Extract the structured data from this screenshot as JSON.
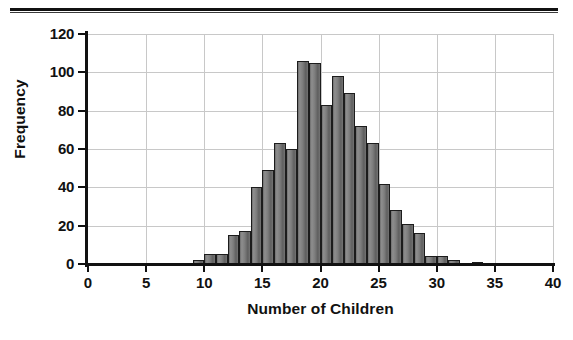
{
  "chart_data": {
    "type": "bar",
    "title": "",
    "subtitle": "",
    "xlabel": "Number of Children",
    "ylabel": "Frequency",
    "xlim": [
      0,
      40
    ],
    "ylim": [
      0,
      120
    ],
    "grid": true,
    "legend": "none",
    "bin_width": 1,
    "x_tick_labels": [
      "0",
      "5",
      "10",
      "15",
      "20",
      "25",
      "30",
      "35",
      "40"
    ],
    "x_ticks": [
      0,
      5,
      10,
      15,
      20,
      25,
      30,
      35,
      40
    ],
    "y_tick_labels": [
      "0",
      "20",
      "40",
      "60",
      "80",
      "100",
      "120"
    ],
    "y_ticks": [
      0,
      20,
      40,
      60,
      80,
      100,
      120
    ],
    "categories": [
      9,
      10,
      11,
      12,
      13,
      14,
      15,
      16,
      17,
      18,
      19,
      20,
      21,
      22,
      23,
      24,
      25,
      26,
      27,
      28,
      29,
      30,
      31,
      32,
      33
    ],
    "values": [
      2,
      5,
      5,
      15,
      17,
      40,
      49,
      63,
      60,
      106,
      105,
      83,
      98,
      89,
      72,
      63,
      42,
      28,
      21,
      16,
      4,
      4,
      2,
      0,
      1
    ],
    "bar_fill_color": "#7d7d7d",
    "bar_edge_color": "#1c1c1c",
    "grid_color": "#c8c8c8",
    "axis_color": "#111111"
  },
  "figure": {
    "background_color": "#ffffff",
    "rule_color": "#111111"
  }
}
